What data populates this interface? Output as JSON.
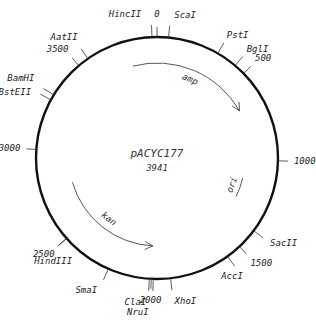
{
  "plasmid": {
    "name": "pACYC177",
    "size_label": "3941",
    "size_bp": 3941
  },
  "scale_markers": [
    {
      "position": 0,
      "label": "0"
    },
    {
      "position": 500,
      "label": "500"
    },
    {
      "position": 1000,
      "label": "1000"
    },
    {
      "position": 1500,
      "label": "1500"
    },
    {
      "position": 2000,
      "label": "2000"
    },
    {
      "position": 2500,
      "label": "2500"
    },
    {
      "position": 3000,
      "label": "3000"
    },
    {
      "position": 3500,
      "label": "3500"
    }
  ],
  "restriction_sites": [
    {
      "name": "HincII",
      "position": 3915
    },
    {
      "name": "ScaI",
      "position": 60
    },
    {
      "name": "PstI",
      "position": 330
    },
    {
      "name": "BglI",
      "position": 440
    },
    {
      "name": "SacII",
      "position": 1390
    },
    {
      "name": "AccI",
      "position": 1580
    },
    {
      "name": "XhoI",
      "position": 1900
    },
    {
      "name": "ClaI",
      "position": 2010
    },
    {
      "name": "NruI",
      "position": 1990
    },
    {
      "name": "SmaI",
      "position": 2230
    },
    {
      "name": "HindIII",
      "position": 2500
    },
    {
      "name": "BstEII",
      "position": 3270
    },
    {
      "name": "BamHI",
      "position": 3300
    },
    {
      "name": "AatII",
      "position": 3560
    }
  ],
  "features": [
    {
      "name": "amp",
      "start": 3780,
      "end": 660,
      "direction": "clockwise"
    },
    {
      "name": "ori",
      "start": 1130,
      "end": 1270,
      "direction": "none"
    },
    {
      "name": "kan",
      "start": 2000,
      "end": 2780,
      "direction": "counterclockwise"
    }
  ]
}
